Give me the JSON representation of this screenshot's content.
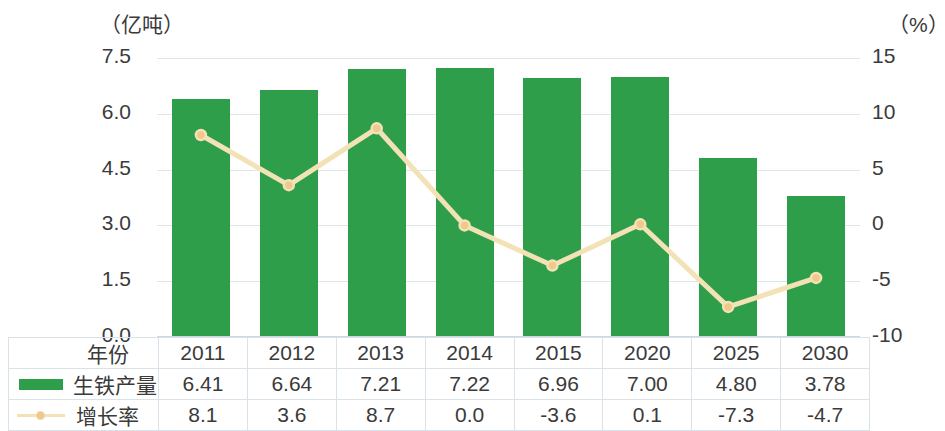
{
  "axes": {
    "left_caption": "（亿吨）",
    "right_caption": "（%）",
    "left_ticks": [
      "7.5",
      "6.0",
      "4.5",
      "3.0",
      "1.5",
      "0.0"
    ],
    "right_ticks": [
      "15",
      "10",
      "5",
      "0",
      "-5",
      "-10"
    ]
  },
  "table": {
    "row_labels": {
      "year": "年份",
      "output": "生铁产量",
      "growth": "增长率"
    }
  },
  "chart_data": {
    "type": "bar",
    "title": "",
    "xlabel": "年份",
    "ylabel": "（亿吨）",
    "y2label": "（%）",
    "categories": [
      "2011",
      "2012",
      "2013",
      "2014",
      "2015",
      "2020",
      "2025",
      "2030"
    ],
    "ylim": [
      0.0,
      7.5
    ],
    "y2lim": [
      -10,
      15
    ],
    "yticks": [
      0.0,
      1.5,
      3.0,
      4.5,
      6.0,
      7.5
    ],
    "y2ticks": [
      -10,
      -5,
      0,
      5,
      10,
      15
    ],
    "grid": true,
    "legend": "in-table",
    "series": [
      {
        "name": "生铁产量",
        "type": "bar",
        "axis": "left",
        "unit": "亿吨",
        "color": "#2e9e4a",
        "values": [
          6.41,
          6.64,
          7.21,
          7.22,
          6.96,
          7.0,
          4.8,
          3.78
        ],
        "labels": [
          "6.41",
          "6.64",
          "7.21",
          "7.22",
          "6.96",
          "7.00",
          "4.80",
          "3.78"
        ]
      },
      {
        "name": "增长率",
        "type": "line",
        "axis": "right",
        "unit": "%",
        "color": "#f2e2b6",
        "marker_color": "#f0c98a",
        "values": [
          8.1,
          3.6,
          8.7,
          0.0,
          -3.6,
          0.1,
          -7.3,
          -4.7
        ],
        "labels": [
          "8.1",
          "3.6",
          "8.7",
          "0.0",
          "-3.6",
          "0.1",
          "-7.3",
          "-4.7"
        ]
      }
    ]
  }
}
